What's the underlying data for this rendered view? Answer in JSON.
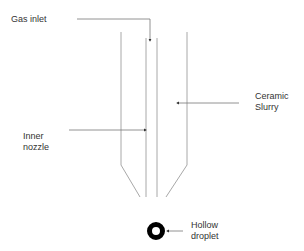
{
  "diagram": {
    "labels": {
      "gas_inlet": "Gas inlet",
      "ceramic_slurry": "Ceramic\nSlurry",
      "inner_nozzle": "Inner\nnozzle",
      "hollow_droplet": "Hollow\ndroplet"
    },
    "colors": {
      "line": "#9a9a9a",
      "arrow": "#555555",
      "droplet": "#000000",
      "text": "#333333"
    }
  }
}
